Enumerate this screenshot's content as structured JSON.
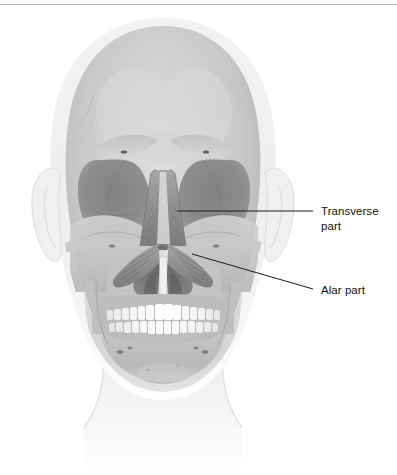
{
  "figure": {
    "view": "anterior",
    "highlighted_muscle": "nasalis",
    "style": "grayscale anatomical illustration"
  },
  "divider": {
    "name": "top-rule",
    "color": "#b3b3b3"
  },
  "labels": [
    {
      "id": "transverse",
      "text": "Transverse\npart",
      "line1": "Transverse",
      "line2": "part",
      "x": 321,
      "y": 204,
      "leader": {
        "type": "straight",
        "from_x": 177,
        "from_y": 211,
        "to_x": 313,
        "to_y": 211,
        "color": "#1a1a1a"
      }
    },
    {
      "id": "alar",
      "text": "Alar part",
      "line1": "Alar part",
      "x": 321,
      "y": 283,
      "leader": {
        "type": "straight",
        "from_x": 192,
        "from_y": 254,
        "to_x": 313,
        "to_y": 289,
        "color": "#1a1a1a"
      }
    }
  ],
  "anatomy": {
    "regions": [
      "cranium",
      "frontal bone",
      "supraorbital ridge",
      "orbit left",
      "orbit right",
      "nasal aperture",
      "zygomatic arch left",
      "zygomatic arch right",
      "maxilla",
      "mandible",
      "upper teeth",
      "lower teeth",
      "ear left",
      "ear right",
      "neck"
    ],
    "muscle_parts": [
      "transverse part of nasalis",
      "alar part of nasalis"
    ]
  },
  "colors": {
    "background": "#ffffff",
    "soft_tissue": "#f0f0f0",
    "skull_light": "#d8d8d8",
    "skull_mid": "#bdbdbd",
    "skull_shadow": "#9a9a9a",
    "orbit_dark": "#8a8a8a",
    "nasal_cavity": "#6e6e6e",
    "muscle": "#8f8f8f",
    "teeth": "#fcfcfc",
    "label_text": "#111111",
    "leader_line": "#1a1a1a",
    "rule": "#b3b3b3"
  }
}
